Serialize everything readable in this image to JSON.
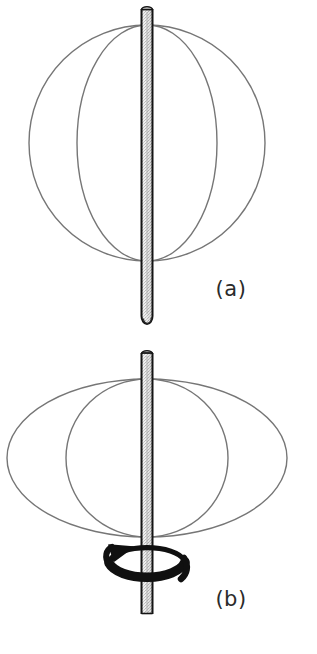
{
  "figure": {
    "background_color": "#ffffff",
    "width": 317,
    "height": 654,
    "curve_color": "#767676",
    "rod_outline_color": "#1a1a1a",
    "rod_fill_color": "#e8e8e8",
    "arrow_color": "#101010",
    "caption_color": "#2b2b2b"
  },
  "panels": [
    {
      "id": "panel-a",
      "caption": "(a)",
      "caption_x": 231,
      "caption_y": 296,
      "description": "Sphere drawn as outline circle with one meridian ellipse, pierced vertically by a rod",
      "sphere": {
        "shape": "circle",
        "center_x": 147,
        "center_y": 143,
        "radius": 118
      },
      "meridian": {
        "shape": "ellipse",
        "center_x": 147,
        "center_y": 143,
        "rx": 70,
        "ry": 118
      },
      "rod": {
        "center_x": 147,
        "top_y": 8,
        "bottom_y": 325,
        "width": 11,
        "cap": "rounded-bottom"
      }
    },
    {
      "id": "panel-b",
      "caption": "(b)",
      "caption_x": 231,
      "caption_y": 606,
      "description": "Flattened oblate spheroid with meridian ellipse, rod through axis, curved rotation arrow at base",
      "spheroid": {
        "shape": "ellipse",
        "center_x": 147,
        "center_y": 458,
        "rx": 140,
        "ry": 79
      },
      "meridian": {
        "shape": "ellipse",
        "center_x": 147,
        "center_y": 458,
        "rx": 81,
        "ry": 79
      },
      "rod": {
        "center_x": 147,
        "top_y": 352,
        "bottom_y": 614,
        "width": 11,
        "cap": "flat"
      },
      "rotation_arrow": {
        "label": "rotation-direction",
        "center_x": 147,
        "center_y": 566,
        "rx": 39,
        "ry": 17,
        "direction": "counterclockwise-viewed-from-above",
        "arrowhead_side": "left"
      }
    }
  ]
}
